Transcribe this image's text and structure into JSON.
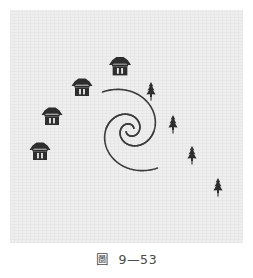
{
  "figure": {
    "caption_label": "圖",
    "caption_number": "9—53",
    "panel": {
      "background_color": "#eeeeee",
      "x": 10,
      "y": 10,
      "width": 233,
      "height": 233
    },
    "line_color": "#3c3c3c",
    "icon_color": "#2e2e2e",
    "center": {
      "x": 120,
      "y": 120
    },
    "spiral_arms": [
      {
        "name": "arm-outer-upper-left",
        "start_angle_deg": 205,
        "turns": 1.28,
        "a": 4.2,
        "b": 0.3
      },
      {
        "name": "arm-outer-lower-right",
        "start_angle_deg": 25,
        "turns": 1.28,
        "a": 4.2,
        "b": 0.3
      },
      {
        "name": "arm-inner-upper-left",
        "start_angle_deg": 205,
        "turns": 0.92,
        "a": 4.2,
        "b": 0.3
      },
      {
        "name": "arm-inner-lower-right",
        "start_angle_deg": 25,
        "turns": 0.92,
        "a": 4.2,
        "b": 0.3
      }
    ],
    "houses": [
      {
        "name": "house-1",
        "x": 42,
        "y": 107,
        "scale": 1.0
      },
      {
        "name": "house-2",
        "x": 72,
        "y": 78,
        "scale": 1.0
      },
      {
        "name": "house-3",
        "x": 110,
        "y": 57,
        "scale": 1.05
      },
      {
        "name": "house-4",
        "x": 30,
        "y": 142,
        "scale": 1.0
      }
    ],
    "trees": [
      {
        "name": "tree-1",
        "x": 141,
        "y": 84,
        "scale": 1.0
      },
      {
        "name": "tree-2",
        "x": 163,
        "y": 117,
        "scale": 1.0
      },
      {
        "name": "tree-3",
        "x": 182,
        "y": 148,
        "scale": 1.0
      },
      {
        "name": "tree-4",
        "x": 208,
        "y": 180,
        "scale": 1.0
      }
    ],
    "legend": {
      "house_symbol": "pavilion",
      "tree_symbol": "conifer"
    }
  }
}
